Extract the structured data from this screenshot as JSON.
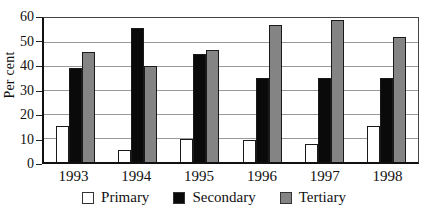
{
  "chart_data": {
    "type": "bar",
    "title": "",
    "xlabel": "",
    "ylabel": "Per cent",
    "categories": [
      "1993",
      "1994",
      "1995",
      "1996",
      "1997",
      "1998"
    ],
    "series": [
      {
        "name": "Primary",
        "color": "#ffffff",
        "values": [
          15,
          5,
          9.5,
          9,
          7.5,
          15
        ]
      },
      {
        "name": "Secondary",
        "color": "#0a0a0a",
        "values": [
          39,
          56,
          45,
          35,
          35,
          35
        ]
      },
      {
        "name": "Tertiary",
        "color": "#848484",
        "values": [
          46,
          40,
          46.5,
          57,
          59,
          52
        ]
      }
    ],
    "ylim": [
      0,
      60
    ],
    "yticks": [
      0,
      10,
      20,
      30,
      40,
      50,
      60
    ],
    "grid": true,
    "legend_position": "bottom"
  },
  "styles": {
    "bar_border": "#1a1a1a",
    "gridline_color": "#999999",
    "axis_color": "#222222",
    "background": "#ffffff"
  }
}
